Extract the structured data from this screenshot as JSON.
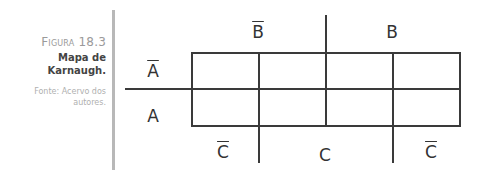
{
  "figure": {
    "number_prefix": "Figura",
    "number": "18.3",
    "title_line1": "Mapa de",
    "title_line2": "Karnaugh.",
    "source_line1": "Fonte: Acervo dos",
    "source_line2": "autores."
  },
  "kmap": {
    "top_labels": [
      {
        "text": "B",
        "negated": true
      },
      {
        "text": "B",
        "negated": false
      }
    ],
    "row_labels": [
      {
        "text": "A",
        "negated": true
      },
      {
        "text": "A",
        "negated": false
      }
    ],
    "bottom_labels": [
      {
        "text": "C",
        "negated": true
      },
      {
        "text": "C",
        "negated": false
      },
      {
        "text": "C",
        "negated": true
      }
    ],
    "rows": 2,
    "cols": 4,
    "cells": [
      [
        "",
        "",
        "",
        ""
      ],
      [
        "",
        "",
        "",
        ""
      ]
    ]
  }
}
